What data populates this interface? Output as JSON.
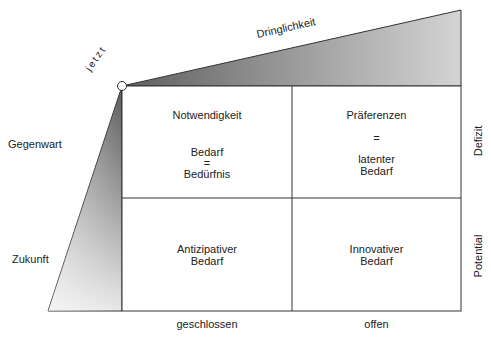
{
  "diagram": {
    "marker": {
      "label": "jetzt"
    },
    "top_axis": {
      "label": "Dringlichkeit"
    },
    "rows": [
      {
        "label": "Gegenwart",
        "side_label": "Defizit"
      },
      {
        "label": "Zukunft",
        "side_label": "Potential"
      }
    ],
    "columns": [
      {
        "label": "geschlossen"
      },
      {
        "label": "offen"
      }
    ],
    "cells": {
      "top_left": {
        "title": "Notwendigkeit",
        "line1": "Bedarf",
        "eq": "=",
        "line2": "Bedürfnis"
      },
      "top_right": {
        "title": "Präferenzen",
        "eq": "=",
        "line1": "latenter",
        "line2": "Bedarf"
      },
      "bottom_left": {
        "line1": "Antizipativer",
        "line2": "Bedarf"
      },
      "bottom_right": {
        "line1": "Innovativer",
        "line2": "Bedarf"
      }
    },
    "colors": {
      "line": "#333333",
      "gradient_dark": "#6e6e6e",
      "gradient_light": "#f2f2f2"
    }
  }
}
